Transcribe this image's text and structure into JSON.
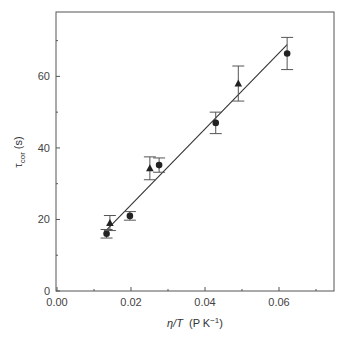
{
  "chart_data": {
    "type": "scatter",
    "title": "",
    "xlabel": "η/T (P K⁻¹)",
    "xlabel_parts": {
      "main": "η/T",
      "unit_prefix": "(P K",
      "superscript": "−1",
      "unit_suffix": ")"
    },
    "ylabel": "τcor (s)",
    "ylabel_parts": {
      "symbol": "τ",
      "subscript": "cor",
      "unit": "(s)"
    },
    "xlim": [
      0.0,
      0.075
    ],
    "ylim": [
      0,
      78
    ],
    "x_ticks": [
      0.0,
      0.02,
      0.04,
      0.06
    ],
    "x_tick_labels": [
      "0.00",
      "0.02",
      "0.04",
      "0.06"
    ],
    "x_minor_ticks": [
      0.01,
      0.03,
      0.05,
      0.07
    ],
    "y_ticks": [
      0,
      20,
      40,
      60
    ],
    "y_tick_labels": [
      "0",
      "20",
      "40",
      "60"
    ],
    "y_minor_ticks": [
      10,
      30,
      50,
      70
    ],
    "grid": false,
    "legend": null,
    "series": [
      {
        "name": "circles",
        "marker": "circle",
        "color": "#222222",
        "points": [
          {
            "x": 0.0134,
            "y": 16.0,
            "err": 1.2
          },
          {
            "x": 0.0197,
            "y": 21.0,
            "err": 1.2
          },
          {
            "x": 0.0276,
            "y": 35.2,
            "err": 2.0
          },
          {
            "x": 0.0429,
            "y": 47.0,
            "err": 3.0
          },
          {
            "x": 0.0622,
            "y": 66.4,
            "err": 4.5
          }
        ]
      },
      {
        "name": "triangles",
        "marker": "triangle",
        "color": "#222222",
        "points": [
          {
            "x": 0.0143,
            "y": 19.0,
            "err": 2.1
          },
          {
            "x": 0.0251,
            "y": 34.3,
            "err": 3.2
          },
          {
            "x": 0.049,
            "y": 58.0,
            "err": 4.9
          }
        ]
      }
    ],
    "fit_line": {
      "x0": 0.0127,
      "y0": 16.3,
      "x1": 0.0622,
      "y1": 68.9,
      "color": "#333333"
    }
  }
}
